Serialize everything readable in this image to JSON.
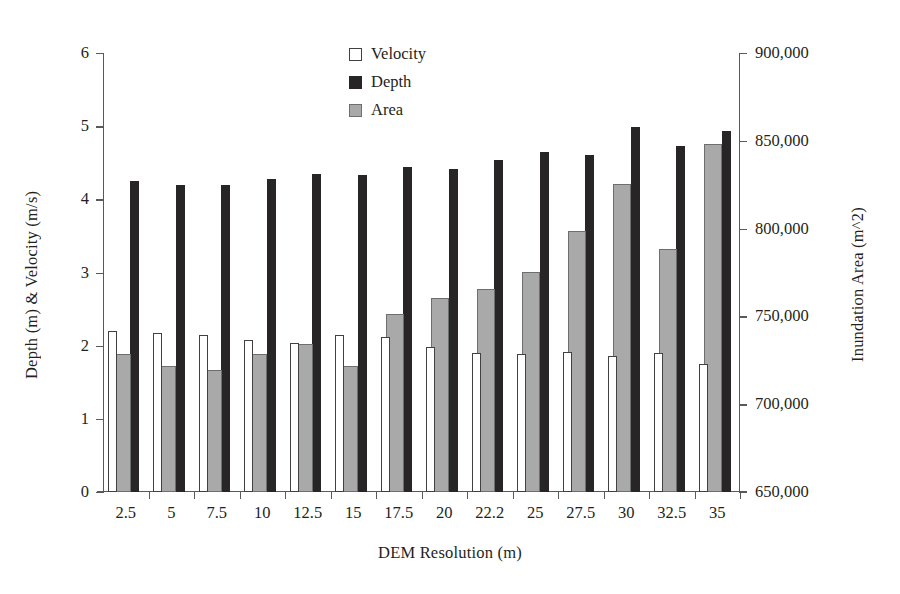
{
  "chart_data": {
    "type": "bar",
    "title": "",
    "xlabel": "DEM Resolution (m)",
    "ylabel": "Depth (m) & Velocity (m/s)",
    "y2label": "Inundation Area (m^2)",
    "grid": false,
    "legend_position": "top-center",
    "categories": [
      "2.5",
      "5",
      "7.5",
      "10",
      "12.5",
      "15",
      "17.5",
      "20",
      "22.2",
      "25",
      "27.5",
      "30",
      "32.5",
      "35"
    ],
    "ylim": [
      0,
      6
    ],
    "yticks": [
      "0",
      "1",
      "2",
      "3",
      "4",
      "5",
      "6"
    ],
    "y2lim": [
      650000,
      900000
    ],
    "y2ticks": [
      "650,000",
      "700,000",
      "750,000",
      "800,000",
      "850,000",
      "900,000"
    ],
    "series": [
      {
        "name": "Velocity",
        "axis": "left",
        "unit": "m/s",
        "color": "#ffffff",
        "edge_color": "#414042",
        "values": [
          2.2,
          2.17,
          2.14,
          2.08,
          2.03,
          2.14,
          2.12,
          1.98,
          1.9,
          1.89,
          1.92,
          1.86,
          1.9,
          1.75
        ]
      },
      {
        "name": "Depth",
        "axis": "left",
        "unit": "m",
        "color": "#272525",
        "values": [
          4.25,
          4.19,
          4.19,
          4.28,
          4.35,
          4.33,
          4.44,
          4.41,
          4.54,
          4.65,
          4.6,
          4.99,
          4.73,
          4.93
        ]
      },
      {
        "name": "Area",
        "axis": "right",
        "unit": "m^2",
        "color": "#a9a9a9",
        "edge_color": "#6d6e70",
        "values": [
          728500,
          722000,
          719500,
          728500,
          734500,
          722000,
          751500,
          760500,
          765500,
          775500,
          798500,
          825500,
          788500,
          848000
        ]
      }
    ]
  },
  "legend": {
    "items": [
      {
        "label": "Velocity",
        "swatch": "open-square-swatch"
      },
      {
        "label": "Depth",
        "swatch": "filled-black-square-swatch"
      },
      {
        "label": "Area",
        "swatch": "filled-gray-square-swatch"
      }
    ]
  }
}
